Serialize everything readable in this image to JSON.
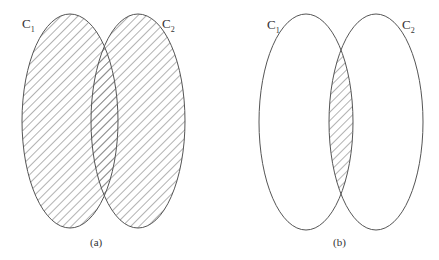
{
  "diagram": {
    "type": "venn",
    "panels": [
      {
        "caption": "(a)",
        "sets": [
          {
            "name": "C",
            "sub": "1"
          },
          {
            "name": "C",
            "sub": "2"
          }
        ],
        "shaded_region": "union"
      },
      {
        "caption": "(b)",
        "sets": [
          {
            "name": "C",
            "sub": "1"
          },
          {
            "name": "C",
            "sub": "2"
          }
        ],
        "shaded_region": "intersection"
      }
    ]
  },
  "colors": {
    "stroke": "#555555",
    "hatch": "#666666",
    "background": "#ffffff"
  }
}
